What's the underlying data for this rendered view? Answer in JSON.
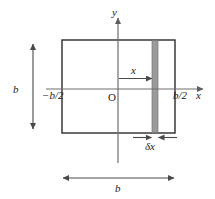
{
  "figure": {
    "type": "geometry-diagram",
    "colors": {
      "background": "#ffffff",
      "outline": "#2b2b2b",
      "axis": "#6e6e6e",
      "dimension_arrow": "#6e6e6e",
      "strip_fill": "#9a9a9a",
      "strip_edge": "#7a7a7a",
      "text": "#1a1a1a"
    },
    "axes": {
      "x_label": "x",
      "y_label": "y",
      "origin_label": "O"
    },
    "labels": {
      "left_edge": "−b/2",
      "right_edge": "b/2",
      "distance_to_strip": "x",
      "strip_width": "δx",
      "height_dimension": "b",
      "width_dimension": "b"
    },
    "geometry": {
      "square_left_px": 62,
      "square_right_px": 175,
      "square_top_px": 40,
      "square_bottom_px": 133,
      "origin_x_px": 118,
      "origin_y_px": 89,
      "strip_left_px": 152,
      "strip_right_px": 158
    }
  }
}
